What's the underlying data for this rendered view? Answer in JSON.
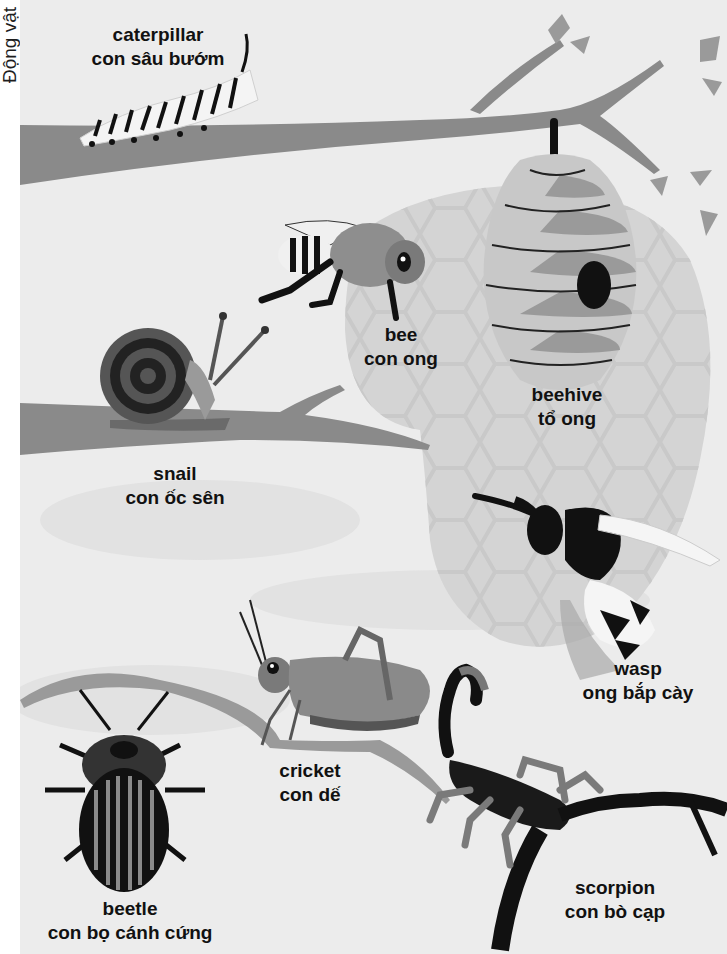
{
  "page": {
    "side_label": "Động vật",
    "colors": {
      "background": "#ececec",
      "margin": "#ffffff",
      "branch": "#8a8a8a",
      "dark": "#141414",
      "hive_light": "#c8c8c8",
      "hive_mid": "#9a9a9a",
      "hexagon_blob": "#d6d6d6"
    }
  },
  "creatures": [
    {
      "id": "caterpillar",
      "english": "caterpillar",
      "vietnamese": "con sâu bướm"
    },
    {
      "id": "bee",
      "english": "bee",
      "vietnamese": "con ong"
    },
    {
      "id": "beehive",
      "english": "beehive",
      "vietnamese": "tổ ong"
    },
    {
      "id": "snail",
      "english": "snail",
      "vietnamese": "con ốc sên"
    },
    {
      "id": "wasp",
      "english": "wasp",
      "vietnamese": "ong bắp cày"
    },
    {
      "id": "cricket",
      "english": "cricket",
      "vietnamese": "con dế"
    },
    {
      "id": "beetle",
      "english": "beetle",
      "vietnamese": "con bọ cánh cứng"
    },
    {
      "id": "scorpion",
      "english": "scorpion",
      "vietnamese": "con bò cạp"
    }
  ]
}
